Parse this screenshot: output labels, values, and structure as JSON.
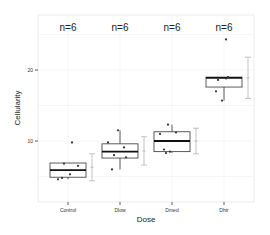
{
  "chart_data": {
    "type": "box",
    "title": "",
    "xlabel": "Dose",
    "ylabel": "Cellularity",
    "categories": [
      "Control",
      "Dlow",
      "Dmed",
      "Dhtr"
    ],
    "n_labels": [
      "n=6",
      "n=6",
      "n=6",
      "n=6"
    ],
    "y_ticks": [
      10,
      20
    ],
    "ylim": [
      2.5,
      26.5
    ],
    "grid": true,
    "legend": null,
    "boxes": [
      {
        "category": "Control",
        "q1": 4.9,
        "median": 5.9,
        "q3": 6.9,
        "whisker_low": 4.6,
        "whisker_high": 6.9,
        "points": [
          4.6,
          4.8,
          5.3,
          6.8,
          6.5,
          9.8
        ],
        "mean": 6.3,
        "sd": 1.9
      },
      {
        "category": "Dlow",
        "q1": 7.6,
        "median": 8.5,
        "q3": 9.6,
        "whisker_low": 6.0,
        "whisker_high": 11.5,
        "points": [
          6.0,
          8.0,
          9.1,
          9.8,
          11.5,
          7.7
        ],
        "mean": 8.6,
        "sd": 2.0
      },
      {
        "category": "Dmed",
        "q1": 8.5,
        "median": 10.0,
        "q3": 11.3,
        "whisker_low": 8.3,
        "whisker_high": 12.3,
        "points": [
          8.3,
          8.5,
          8.8,
          11.2,
          11.0,
          12.3
        ],
        "mean": 10.0,
        "sd": 1.8
      },
      {
        "category": "Dhtr",
        "q1": 17.6,
        "median": 18.9,
        "q3": 19.0,
        "whisker_low": 15.7,
        "whisker_high": 19.0,
        "points": [
          15.7,
          17.0,
          18.8,
          19.0,
          18.6,
          24.3
        ],
        "mean": 18.9,
        "sd": 2.9
      }
    ]
  }
}
